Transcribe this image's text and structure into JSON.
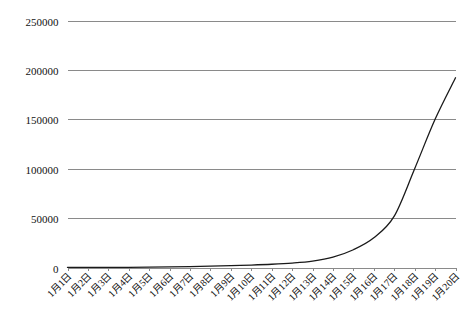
{
  "chart_data": {
    "type": "line",
    "title": "",
    "subtitle": "",
    "xlabel": "",
    "ylabel": "",
    "grid": true,
    "legend": false,
    "legend_position": "none",
    "categories": [
      "1月1日",
      "1月2日",
      "1月3日",
      "1月4日",
      "1月5日",
      "1月6日",
      "1月7日",
      "1月8日",
      "1月9日",
      "1月10日",
      "1月11日",
      "1月12日",
      "1月13日",
      "1月14日",
      "1月15日",
      "1月16日",
      "1月17日",
      "1月18日",
      "1月19日",
      "1月20日"
    ],
    "values": [
      40,
      70,
      120,
      210,
      360,
      600,
      950,
      1400,
      1900,
      2500,
      3300,
      4500,
      6500,
      10500,
      18000,
      30000,
      52000,
      100000,
      150000,
      192000
    ],
    "series": [
      {
        "name": "累计",
        "color": "#1a1a1a",
        "values": [
          40,
          70,
          120,
          210,
          360,
          600,
          950,
          1400,
          1900,
          2500,
          3300,
          4500,
          6500,
          10500,
          18000,
          30000,
          52000,
          100000,
          150000,
          192000
        ]
      }
    ],
    "ylim": [
      0,
      250000
    ],
    "yticks": [
      0,
      50000,
      100000,
      150000,
      200000,
      250000
    ],
    "ytick_labels": [
      "0",
      "50000",
      "100000",
      "150000",
      "200000",
      "250000"
    ],
    "xlim": [
      0,
      19
    ],
    "colors": {
      "series_line": "#1a1a1a",
      "gridline": "#8a8a8a",
      "axis": "#8a8a8a",
      "background": "#ffffff",
      "text": "#111111"
    }
  }
}
